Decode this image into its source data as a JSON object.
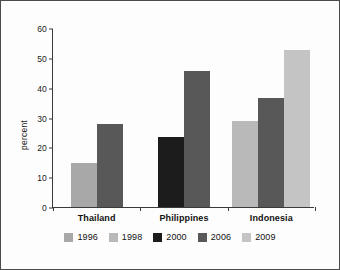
{
  "chart_data": {
    "type": "bar",
    "title": "",
    "subtitle": "",
    "xlabel": "",
    "ylabel": "percent",
    "categories": [
      "Thailand",
      "Philippines",
      "Indonesia"
    ],
    "ylim": [
      0,
      60
    ],
    "yticks": [
      0,
      10,
      20,
      30,
      40,
      50,
      60
    ],
    "ytick_labels": [
      "0",
      "10",
      "20",
      "30",
      "40",
      "50",
      "60"
    ],
    "grid": false,
    "legend_position": "bottom",
    "series": [
      {
        "name": "1996",
        "color": "#a8a8a8",
        "values": [
          14.8,
          null,
          null
        ]
      },
      {
        "name": "1998",
        "color": "#b9b9b9",
        "values": [
          null,
          null,
          28.7
        ]
      },
      {
        "name": "2000",
        "color": "#1c1c1c",
        "values": [
          null,
          23.6,
          null
        ]
      },
      {
        "name": "2006",
        "color": "#585858",
        "values": [
          27.8,
          45.7,
          36.7
        ]
      },
      {
        "name": "2009",
        "color": "#c4c4c4",
        "values": [
          null,
          null,
          52.7
        ]
      }
    ],
    "bars": [
      {
        "group": "Thailand",
        "series": "1996",
        "value": 14.8,
        "color": "#a8a8a8"
      },
      {
        "group": "Thailand",
        "series": "2006",
        "value": 27.8,
        "color": "#585858"
      },
      {
        "group": "Philippines",
        "series": "2000",
        "value": 23.6,
        "color": "#1c1c1c"
      },
      {
        "group": "Philippines",
        "series": "2006",
        "value": 45.7,
        "color": "#585858"
      },
      {
        "group": "Indonesia",
        "series": "1998",
        "value": 28.7,
        "color": "#b9b9b9"
      },
      {
        "group": "Indonesia",
        "series": "2006",
        "value": 36.7,
        "color": "#585858"
      },
      {
        "group": "Indonesia",
        "series": "2009",
        "value": 52.7,
        "color": "#c4c4c4"
      }
    ]
  },
  "axis": {
    "y_label": "percent",
    "y_ticks": [
      "60",
      "50",
      "40",
      "30",
      "20",
      "10",
      "0"
    ]
  },
  "categories": [
    {
      "label": "Thailand"
    },
    {
      "label": "Philippines"
    },
    {
      "label": "Indonesia"
    }
  ],
  "legend": {
    "items": [
      {
        "label": "1996",
        "color": "#a8a8a8"
      },
      {
        "label": "1998",
        "color": "#b9b9b9"
      },
      {
        "label": "2000",
        "color": "#1c1c1c"
      },
      {
        "label": "2006",
        "color": "#585858"
      },
      {
        "label": "2009",
        "color": "#c4c4c4"
      }
    ]
  }
}
